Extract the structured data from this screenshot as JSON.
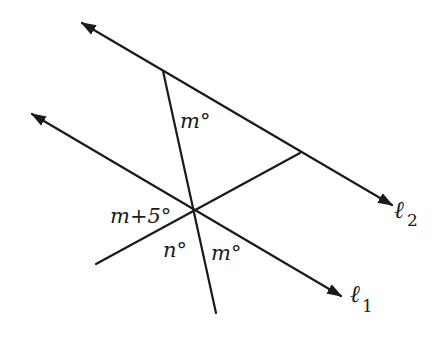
{
  "diagram": {
    "lines": {
      "l2": {
        "label_main": "ℓ",
        "label_sub": "2"
      },
      "l1": {
        "label_main": "ℓ",
        "label_sub": "1"
      }
    },
    "angles": {
      "top_transversal_l2": "m°",
      "left_at_l1": "m+5°",
      "lower_left_at_l1": "n°",
      "lower_right_at_l1": "m°"
    },
    "colors": {
      "stroke": "#1a1a1a",
      "background": "#ffffff"
    }
  }
}
